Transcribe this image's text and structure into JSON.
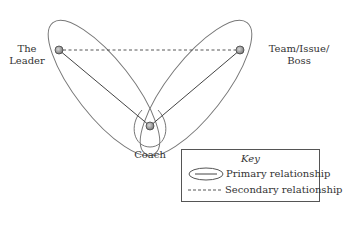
{
  "nodes": {
    "leader": {
      "label_line1": "The",
      "label_line2": "Leader"
    },
    "team": {
      "label_line1": "Team/Issue/",
      "label_line2": "Boss"
    },
    "coach": {
      "label": "Coach"
    }
  },
  "key": {
    "title": "Key",
    "primary": "Primary relationship",
    "secondary": "Secondary relationship"
  },
  "colors": {
    "line": "#555555",
    "node_fill": "#9a9a9a",
    "node_stroke": "#444444"
  }
}
